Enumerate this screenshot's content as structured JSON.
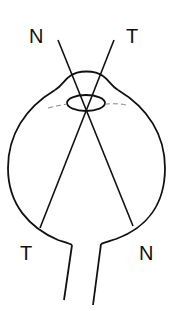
{
  "diagram": {
    "type": "eye-cross-section",
    "labels": {
      "top_left": "N",
      "top_right": "T",
      "bottom_left": "T",
      "bottom_right": "N"
    },
    "stroke_color": "#111111",
    "dashed_color": "#888888",
    "background": "#ffffff"
  }
}
